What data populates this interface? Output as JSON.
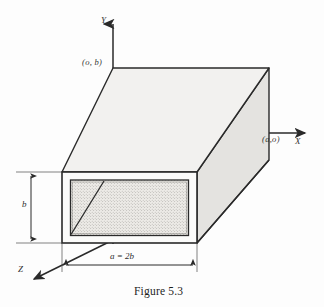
{
  "figure": {
    "caption": "Figure 5.3",
    "type": "technical-diagram",
    "axes": {
      "y_label": "Y",
      "x_label": "X",
      "z_label": "Z"
    },
    "coordinate_labels": {
      "top_left": "(o, b)",
      "right": "(a,o)"
    },
    "dimensions": {
      "height_label": "b",
      "width_label": "a = 2b"
    },
    "colors": {
      "line": "#2a2a2a",
      "top_face_fill": "#f2f1ef",
      "side_face_fill": "#e4e3e0",
      "wall_fill": "#fbfbfa",
      "interior_fill": "#ebeae6",
      "background": "#fdfdfd"
    }
  }
}
